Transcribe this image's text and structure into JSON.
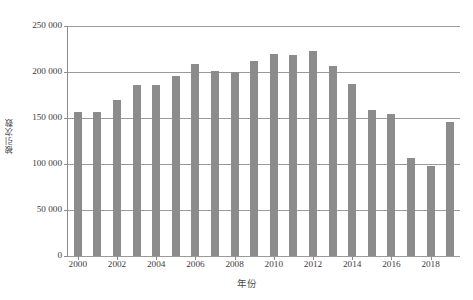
{
  "chart_data": {
    "type": "bar",
    "title": "",
    "xlabel": "年份",
    "ylabel": "被引次数",
    "categories": [
      "2000",
      "2001",
      "2002",
      "2003",
      "2004",
      "2005",
      "2006",
      "2007",
      "2008",
      "2009",
      "2010",
      "2011",
      "2012",
      "2013",
      "2014",
      "2015",
      "2016",
      "2017",
      "2018",
      "2019"
    ],
    "values": [
      156000,
      157000,
      170000,
      186000,
      186000,
      196000,
      209000,
      201000,
      200000,
      212000,
      220000,
      219000,
      223000,
      206000,
      187000,
      159000,
      154000,
      107000,
      98000,
      146000
    ],
    "ylim": [
      0,
      250000
    ],
    "ytick_values": [
      0,
      50000,
      100000,
      150000,
      200000,
      250000
    ],
    "ytick_labels": [
      "0",
      "50 000",
      "100 000",
      "150 000",
      "200 000",
      "250 000"
    ],
    "xtick_labels": [
      "2000",
      "2002",
      "2004",
      "2006",
      "2008",
      "2010",
      "2012",
      "2014",
      "2016",
      "2018"
    ],
    "grid": true,
    "legend": "none",
    "series_color": "#8c8c8c",
    "gridline_color": "#9a9a9a",
    "background": "#ffffff"
  }
}
